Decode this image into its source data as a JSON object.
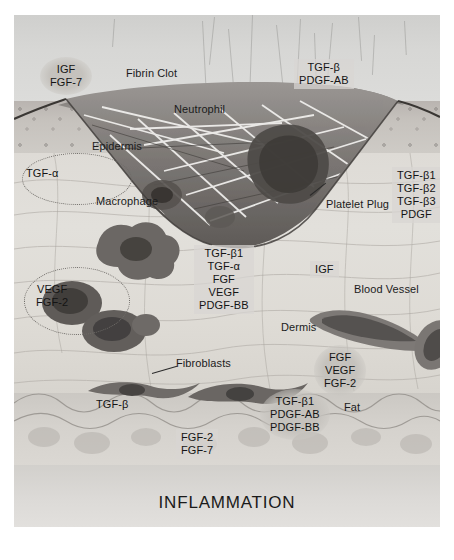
{
  "figure": {
    "title": "INFLAMMATION",
    "type": "histology-wound-healing-diagram"
  },
  "anatomy_labels": {
    "fibrin_clot": "Fibrin Clot",
    "neutrophil": "Neutrophil",
    "epidermis": "Epidermis",
    "macrophage": "Macrophage",
    "platelet_plug": "Platelet Plug",
    "dermis": "Dermis",
    "blood_vessel": "Blood Vessel",
    "fibroblasts": "Fibroblasts",
    "fat": "Fat"
  },
  "growth_factors": {
    "top_left": {
      "line1": "IGF",
      "line2": "FGF-7"
    },
    "top_right": {
      "line1": "TGF-β",
      "line2": "PDGF-AB"
    },
    "epidermis_left": {
      "line1": "TGF-α"
    },
    "platelet_right": {
      "line1": "TGF-β1",
      "line2": "TGF-β2",
      "line3": "TGF-β3",
      "line4": "PDGF"
    },
    "macrophage_center": {
      "line1": "TGF-β1",
      "line2": "TGF-α",
      "line3": "FGF",
      "line4": "VEGF",
      "line5": "PDGF-BB"
    },
    "vessel_igf": {
      "line1": "IGF"
    },
    "left_vegf": {
      "line1": "VEGF",
      "line2": "FGF-2"
    },
    "right_fgf": {
      "line1": "FGF",
      "line2": "VEGF",
      "line3": "FGF-2"
    },
    "fibroblast_left": {
      "line1": "TGF-β"
    },
    "fibroblast_center": {
      "line1": "TGF-β1",
      "line2": "PDGF-AB",
      "line3": "PDGF-BB"
    },
    "fat_fgf": {
      "line1": "FGF-2",
      "line2": "FGF-7"
    }
  },
  "colors": {
    "page_background": "#ffffff",
    "photo_background": "#d8d8d6",
    "epidermis": "#c4c0bb",
    "dermis": "#e0ddd8",
    "fat": "#d4d1cc",
    "clot": "#7e7b78",
    "text": "#1b1b1b"
  }
}
